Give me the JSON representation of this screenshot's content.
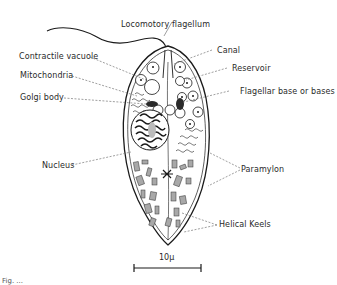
{
  "figure": {
    "caption_partial": "Fig. ...",
    "labels": {
      "locomotory_flagellum": "Locomotory flagellum",
      "contractile_vacuole": "Contractile vacuole",
      "mitochondria": "Mitochondria",
      "golgi_body": "Golgi body",
      "nucleus": "Nucleus",
      "canal": "Canal",
      "reservoir": "Reservoir",
      "flagellar_base": "Flagellar base or bases",
      "paramylon": "Paramylon",
      "helical_keels": "Helical Keels"
    },
    "scale_bar": {
      "label": "10μ"
    }
  },
  "colors": {
    "line": "#1a1a1a",
    "leader": "#777777",
    "grain": "#9a9a9a",
    "background": "#ffffff"
  }
}
